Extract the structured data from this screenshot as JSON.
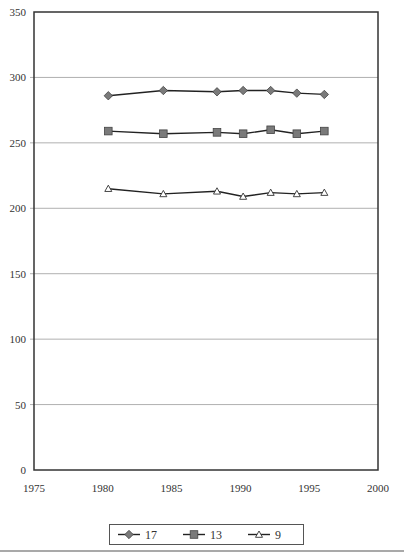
{
  "chart_data": {
    "type": "line",
    "title": "",
    "xlabel": "",
    "ylabel": "",
    "xlim": [
      1975,
      2000
    ],
    "ylim": [
      0,
      350
    ],
    "x_ticks": [
      1975,
      1980,
      1985,
      1990,
      1995,
      2000
    ],
    "y_ticks": [
      0,
      50,
      100,
      150,
      200,
      250,
      300,
      350
    ],
    "grid": {
      "y": true,
      "x": false
    },
    "legend_position": "bottom",
    "x": [
      1980.4,
      1984.4,
      1988.3,
      1990.2,
      1992.2,
      1994.1,
      1996.1
    ],
    "series": [
      {
        "name": "17",
        "marker": "diamond",
        "fill": "#7a7a7a",
        "values": [
          286,
          290,
          289,
          290,
          290,
          288,
          287
        ]
      },
      {
        "name": "13",
        "marker": "square",
        "fill": "#7a7a7a",
        "values": [
          259,
          257,
          258,
          257,
          260,
          257,
          259
        ]
      },
      {
        "name": "9",
        "marker": "triangle",
        "fill": "#ffffff",
        "values": [
          215,
          211,
          213,
          209,
          212,
          211,
          212
        ]
      }
    ]
  },
  "legend": {
    "items": [
      {
        "label": "17",
        "marker": "diamond"
      },
      {
        "label": "13",
        "marker": "square"
      },
      {
        "label": "9",
        "marker": "triangle"
      }
    ]
  },
  "colors": {
    "line": "#222222",
    "marker_fill": "#7a7a7a",
    "gridline": "#b0b0b0",
    "axis": "#333333"
  }
}
